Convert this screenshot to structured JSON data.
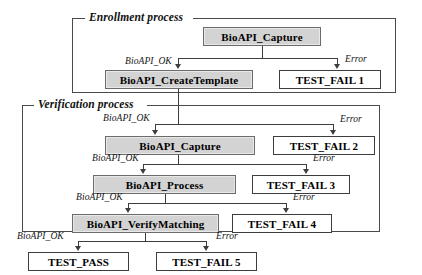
{
  "diagram": {
    "type": "flowchart",
    "colors": {
      "process_fill": "#d3d3d3",
      "terminal_fill": "#ffffff",
      "line": "#3d3d3d",
      "group_border": "#4a4a4a",
      "background": "#ffffff"
    },
    "groups": [
      {
        "id": "enrollment",
        "label": "Enrollment process"
      },
      {
        "id": "verification",
        "label": "Verification process"
      }
    ],
    "nodes": {
      "enroll_capture": "BioAPI_Capture",
      "enroll_create_template": "BioAPI_CreateTemplate",
      "test_fail_1": "TEST_FAIL 1",
      "verify_capture": "BioAPI_Capture",
      "test_fail_2": "TEST_FAIL 2",
      "verify_process": "BioAPI_Process",
      "test_fail_3": "TEST_FAIL 3",
      "verify_matching": "BioAPI_VerifyMatching",
      "test_fail_4": "TEST_FAIL 4",
      "test_pass": "TEST_PASS",
      "test_fail_5": "TEST_FAIL 5"
    },
    "edges": {
      "ok_1": "BioAPI_OK",
      "error_1": "Error",
      "ok_2": "BioAPI_OK",
      "error_2": "Error",
      "ok_3": "BioAPI_OK",
      "error_3": "Error",
      "ok_4": "BioAPI_OK",
      "error_4": "Error",
      "ok_5": "BioAPI_OK",
      "error_5": "Error"
    }
  }
}
